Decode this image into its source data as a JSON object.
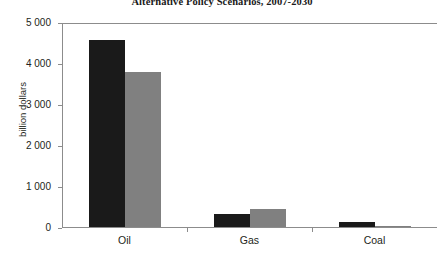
{
  "chart_data": {
    "type": "bar",
    "title": "Alternative Policy Scenarios, 2007-2030",
    "xlabel": "",
    "ylabel": "billion dollars",
    "categories": [
      "Oil",
      "Gas",
      "Coal"
    ],
    "series": [
      {
        "name": "series-1-dark",
        "values": [
          4550,
          320,
          120
        ]
      },
      {
        "name": "series-2-grey",
        "values": [
          3780,
          440,
          20
        ]
      }
    ],
    "ylim": [
      0,
      5000
    ],
    "ytick_values": [
      5000,
      4000,
      3000,
      2000,
      1000,
      0
    ],
    "ytick_labels": [
      "5 000",
      "4 000",
      "3 000",
      "2 000",
      "1 000",
      "0"
    ],
    "grid": false,
    "legend": "none",
    "colors": {
      "series_dark": "#1a1a1a",
      "series_grey": "#808080",
      "axis": "#8c8c8c",
      "text": "#231f20",
      "background": "#ffffff"
    }
  }
}
